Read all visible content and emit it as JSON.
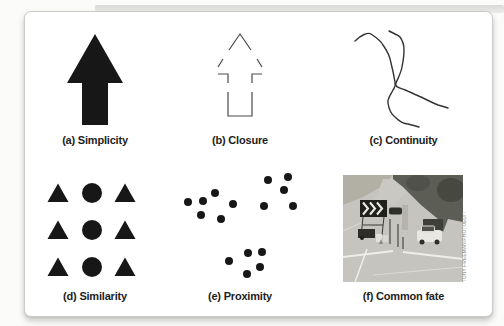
{
  "figure": {
    "panels": [
      {
        "id": "a",
        "caption": "(a) Simplicity",
        "type": "solid-arrow"
      },
      {
        "id": "b",
        "caption": "(b) Closure",
        "type": "outline-arrow-with-gaps"
      },
      {
        "id": "c",
        "caption": "(c) Continuity",
        "type": "crossing-curves"
      },
      {
        "id": "d",
        "caption": "(d) Similarity",
        "type": "shape-grid",
        "grid": {
          "rows": [
            [
              "triangle",
              "circle",
              "triangle"
            ],
            [
              "triangle",
              "circle",
              "triangle"
            ],
            [
              "triangle",
              "circle",
              "triangle"
            ]
          ]
        }
      },
      {
        "id": "e",
        "caption": "(e) Proximity",
        "type": "dot-clusters",
        "dot_clusters": [
          [
            [
              23,
              40
            ],
            [
              38,
              39
            ],
            [
              50,
              31
            ],
            [
              36,
              53
            ],
            [
              56,
              57
            ],
            [
              68,
              42
            ]
          ],
          [
            [
              103,
              18
            ],
            [
              123,
              15
            ],
            [
              119,
              28
            ],
            [
              99,
              44
            ],
            [
              128,
              44
            ]
          ],
          [
            [
              64,
              99
            ],
            [
              83,
              91
            ],
            [
              97,
              90
            ],
            [
              95,
              105
            ],
            [
              82,
              112
            ]
          ]
        ]
      },
      {
        "id": "f",
        "caption": "(f) Common fate",
        "type": "photo",
        "photo_credit": "TONY FREEMAN/PHOTOEDIT"
      }
    ],
    "colors": {
      "ink": "#171717",
      "outline": "#4a4a4a",
      "curve": "#333333",
      "caption": "#1d1d1d",
      "card_border": "#cccccb",
      "credit": "#8b8b87"
    }
  }
}
